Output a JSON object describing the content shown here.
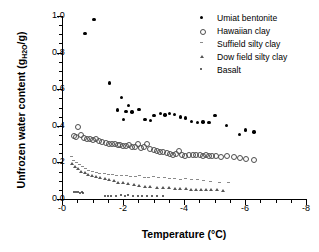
{
  "chart_data": {
    "type": "scatter",
    "title": "",
    "xlabel": "Temperature (°C)",
    "ylabel": "Unfrozen water content (gH2O/g)",
    "ylabel_main": "Unfrozen water content (g",
    "ylabel_sub": "H",
    "ylabel_sub2": "2",
    "ylabel_sub3": "O",
    "ylabel_tail": "/g)",
    "xlim": [
      0,
      -8
    ],
    "ylim": [
      0.0,
      1.0
    ],
    "x_reversed": true,
    "grid": false,
    "legend_position": "top-right",
    "xticks": [
      "-0",
      "-2",
      "-4",
      "-6",
      "-8"
    ],
    "xtick_values": [
      0,
      -2,
      -4,
      -6,
      -8
    ],
    "xminor_step": 0.5,
    "yticks": [
      "0.0",
      "0.2",
      "0.4",
      "0.6",
      "0.8",
      "1.0"
    ],
    "ytick_values": [
      0.0,
      0.2,
      0.4,
      0.6,
      0.8,
      1.0
    ],
    "yminor_step": 0.05,
    "series": [
      {
        "name": "Umiat bentonite",
        "marker": "filled-circle",
        "color": "#000000",
        "points": [
          [
            -0.75,
            0.905
          ],
          [
            -1.05,
            0.982
          ],
          [
            -1.55,
            0.634
          ],
          [
            -1.82,
            0.487
          ],
          [
            -1.95,
            0.556
          ],
          [
            -2.02,
            0.434
          ],
          [
            -2.1,
            0.478
          ],
          [
            -2.18,
            0.512
          ],
          [
            -2.3,
            0.476
          ],
          [
            -2.52,
            0.489
          ],
          [
            -2.72,
            0.433
          ],
          [
            -2.9,
            0.43
          ],
          [
            -3.02,
            0.455
          ],
          [
            -3.22,
            0.468
          ],
          [
            -3.38,
            0.459
          ],
          [
            -3.52,
            0.468
          ],
          [
            -3.68,
            0.462
          ],
          [
            -3.88,
            0.448
          ],
          [
            -4.05,
            0.443
          ],
          [
            -4.25,
            0.424
          ],
          [
            -4.45,
            0.418
          ],
          [
            -4.62,
            0.421
          ],
          [
            -4.82,
            0.419
          ],
          [
            -5.02,
            0.455
          ],
          [
            -5.4,
            0.401
          ],
          [
            -5.82,
            0.351
          ],
          [
            -6.02,
            0.378
          ],
          [
            -6.3,
            0.367
          ]
        ]
      },
      {
        "name": "Hawaiian clay",
        "marker": "open-circle",
        "color": "#4d4d4d",
        "points": [
          [
            -0.38,
            0.348
          ],
          [
            -0.45,
            0.34
          ],
          [
            -0.52,
            0.392
          ],
          [
            -0.62,
            0.352
          ],
          [
            -0.72,
            0.334
          ],
          [
            -0.82,
            0.331
          ],
          [
            -0.92,
            0.328
          ],
          [
            -1.02,
            0.324
          ],
          [
            -1.12,
            0.33
          ],
          [
            -1.22,
            0.32
          ],
          [
            -1.3,
            0.312
          ],
          [
            -1.42,
            0.308
          ],
          [
            -1.52,
            0.304
          ],
          [
            -1.62,
            0.3
          ],
          [
            -1.72,
            0.3
          ],
          [
            -1.82,
            0.298
          ],
          [
            -1.9,
            0.295
          ],
          [
            -2.0,
            0.292
          ],
          [
            -2.1,
            0.29
          ],
          [
            -2.2,
            0.298
          ],
          [
            -2.3,
            0.286
          ],
          [
            -2.4,
            0.284
          ],
          [
            -2.5,
            0.3
          ],
          [
            -2.58,
            0.278
          ],
          [
            -2.68,
            0.284
          ],
          [
            -2.78,
            0.3
          ],
          [
            -2.88,
            0.276
          ],
          [
            -3.0,
            0.268
          ],
          [
            -3.12,
            0.262
          ],
          [
            -3.22,
            0.258
          ],
          [
            -3.32,
            0.256
          ],
          [
            -3.42,
            0.252
          ],
          [
            -3.52,
            0.248
          ],
          [
            -3.62,
            0.242
          ],
          [
            -3.72,
            0.248
          ],
          [
            -3.82,
            0.262
          ],
          [
            -3.92,
            0.24
          ],
          [
            -4.02,
            0.238
          ],
          [
            -4.15,
            0.244
          ],
          [
            -4.28,
            0.242
          ],
          [
            -4.4,
            0.24
          ],
          [
            -4.52,
            0.24
          ],
          [
            -4.62,
            0.238
          ],
          [
            -4.72,
            0.244
          ],
          [
            -4.82,
            0.238
          ],
          [
            -4.92,
            0.236
          ],
          [
            -5.05,
            0.234
          ],
          [
            -5.2,
            0.232
          ],
          [
            -5.4,
            0.236
          ],
          [
            -5.62,
            0.228
          ],
          [
            -5.82,
            0.226
          ],
          [
            -6.02,
            0.222
          ],
          [
            -6.3,
            0.212
          ]
        ]
      },
      {
        "name": "Suffield silty clay",
        "marker": "dash",
        "color": "#8a8a8a",
        "points": [
          [
            -0.3,
            0.23
          ],
          [
            -0.38,
            0.212
          ],
          [
            -0.46,
            0.2
          ],
          [
            -0.56,
            0.188
          ],
          [
            -0.66,
            0.176
          ],
          [
            -0.76,
            0.166
          ],
          [
            -0.88,
            0.158
          ],
          [
            -1.0,
            0.15
          ],
          [
            -1.12,
            0.146
          ],
          [
            -1.24,
            0.142
          ],
          [
            -1.38,
            0.138
          ],
          [
            -1.52,
            0.134
          ],
          [
            -1.66,
            0.132
          ],
          [
            -1.8,
            0.128
          ],
          [
            -1.95,
            0.126
          ],
          [
            -2.1,
            0.13
          ],
          [
            -2.25,
            0.124
          ],
          [
            -2.4,
            0.122
          ],
          [
            -2.55,
            0.126
          ],
          [
            -2.7,
            0.12
          ],
          [
            -2.85,
            0.118
          ],
          [
            -3.0,
            0.122
          ],
          [
            -3.18,
            0.116
          ],
          [
            -3.35,
            0.118
          ],
          [
            -3.52,
            0.112
          ],
          [
            -3.7,
            0.114
          ],
          [
            -3.88,
            0.108
          ],
          [
            -4.05,
            0.11
          ],
          [
            -4.25,
            0.106
          ],
          [
            -4.45,
            0.104
          ],
          [
            -4.65,
            0.102
          ],
          [
            -4.88,
            0.098
          ],
          [
            -5.15,
            0.092
          ],
          [
            -5.45,
            0.088
          ]
        ]
      },
      {
        "name": "Dow field silty clay",
        "marker": "triangle",
        "color": "#555555",
        "points": [
          [
            -0.32,
            0.196
          ],
          [
            -0.42,
            0.178
          ],
          [
            -0.52,
            0.164
          ],
          [
            -0.62,
            0.152
          ],
          [
            -0.74,
            0.142
          ],
          [
            -0.86,
            0.134
          ],
          [
            -0.98,
            0.128
          ],
          [
            -1.12,
            0.122
          ],
          [
            -1.26,
            0.116
          ],
          [
            -1.4,
            0.11
          ],
          [
            -1.55,
            0.104
          ],
          [
            -1.7,
            0.098
          ],
          [
            -1.85,
            0.092
          ],
          [
            -2.0,
            0.088
          ],
          [
            -2.18,
            0.082
          ],
          [
            -2.36,
            0.078
          ],
          [
            -2.54,
            0.074
          ],
          [
            -2.72,
            0.07
          ],
          [
            -2.9,
            0.068
          ],
          [
            -3.1,
            0.064
          ],
          [
            -3.3,
            0.062
          ],
          [
            -3.5,
            0.06
          ],
          [
            -3.7,
            0.058
          ],
          [
            -3.88,
            0.056
          ],
          [
            -4.05,
            0.055
          ],
          [
            -4.22,
            0.054
          ],
          [
            -4.38,
            0.053
          ],
          [
            -4.55,
            0.052
          ],
          [
            -4.72,
            0.051
          ],
          [
            -4.9,
            0.05
          ],
          [
            -5.08,
            0.05
          ],
          [
            -5.28,
            0.048
          ]
        ]
      },
      {
        "name": "Basalt",
        "marker": "small-dot",
        "color": "#333333",
        "points": [
          [
            -0.4,
            0.038
          ],
          [
            -0.46,
            0.036
          ],
          [
            -0.52,
            0.037
          ],
          [
            -0.58,
            0.035
          ],
          [
            -0.64,
            0.036
          ],
          [
            -0.7,
            0.034
          ],
          [
            -1.42,
            0.018
          ],
          [
            -1.52,
            0.016
          ],
          [
            -1.62,
            0.018
          ],
          [
            -1.78,
            0.016
          ],
          [
            -1.92,
            0.022
          ],
          [
            -2.05,
            0.018
          ],
          [
            -2.18,
            0.02
          ],
          [
            -2.32,
            0.016
          ],
          [
            -2.48,
            0.018
          ],
          [
            -2.62,
            0.016
          ],
          [
            -2.78,
            0.018
          ],
          [
            -2.95,
            0.016
          ],
          [
            -3.12,
            0.018
          ],
          [
            -3.3,
            0.016
          ]
        ]
      }
    ]
  },
  "legend": {
    "items": [
      {
        "label": "Umiat bentonite",
        "marker": "filled-circle"
      },
      {
        "label": "Hawaiian clay",
        "marker": "open-circle"
      },
      {
        "label": "Suffield silty clay",
        "marker": "dash"
      },
      {
        "label": "Dow field silty clay",
        "marker": "triangle"
      },
      {
        "label": "Basalt",
        "marker": "small-dot"
      }
    ]
  }
}
